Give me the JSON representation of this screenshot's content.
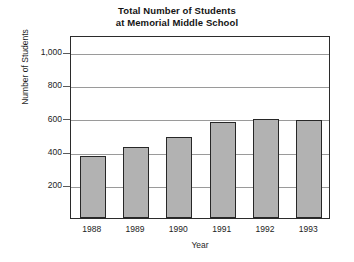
{
  "chart_data": {
    "type": "bar",
    "title": "Total Number of Students at Memorial Middle School",
    "title_lines": [
      "Total Number of Students",
      "at Memorial Middle School"
    ],
    "xlabel": "Year",
    "ylabel": "Number of Students",
    "categories": [
      "1988",
      "1989",
      "1990",
      "1991",
      "1992",
      "1993"
    ],
    "values": [
      375,
      425,
      490,
      580,
      595,
      590
    ],
    "ylim": [
      0,
      1100
    ],
    "yticks": [
      200,
      400,
      600,
      800,
      1000
    ],
    "ytick_labels": [
      "200",
      "400",
      "600",
      "800",
      "1,000"
    ],
    "grid": "horizontal",
    "legend": "none",
    "bar_color": "#b2b2b2",
    "bar_edge_color": "#272727",
    "frame_color": "#2b2b2b",
    "gridline_color": "#9a9a9a",
    "background": "#ffffff"
  }
}
